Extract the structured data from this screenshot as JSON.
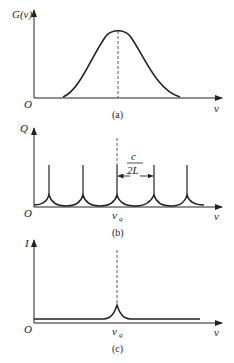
{
  "panels": [
    {
      "id": "a",
      "caption": "(a)",
      "y_label": "G(ν)",
      "x_label": "ν",
      "origin": "O",
      "curve": "gaussian gain profile"
    },
    {
      "id": "b",
      "caption": "(b)",
      "y_label": "Q",
      "x_label": "ν",
      "origin": "O",
      "center_label": "ν",
      "center_sub": "q",
      "spacing_num": "c",
      "spacing_den": "2L",
      "curve": "periodic resonance peaks"
    },
    {
      "id": "c",
      "caption": "(c)",
      "y_label": "I",
      "x_label": "ν",
      "origin": "O",
      "center_label": "ν",
      "center_sub": "q",
      "curve": "single narrow peak"
    }
  ]
}
